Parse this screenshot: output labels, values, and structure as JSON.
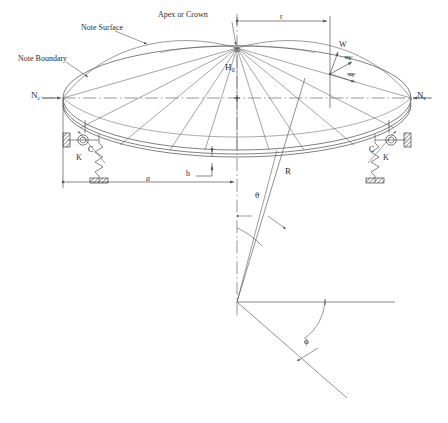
{
  "figure": {
    "type": "engineering-diagram",
    "background": "#ffffff",
    "line_color": "#555555",
    "text_color": "#2b2b2b"
  },
  "labels": {
    "note_surface": "Note Surface",
    "note_boundary": "Note Boundary",
    "apex": "Apex or Crown",
    "nc_left": "N",
    "nc_left_sub": "c",
    "nc_right": "N",
    "nc_right_sub": "c",
    "height": "H",
    "height_sub": "0",
    "radius_r": "r",
    "radius_a": "a",
    "thickness_h": "h",
    "radius_R": "R",
    "angle_theta": "θ",
    "angle_phi": "ϕ",
    "disp_w": "W",
    "disp_u_phi": "u",
    "disp_u_phi_sub": "ϕ",
    "disp_u_theta": "u",
    "disp_u_theta_sub": "θ",
    "spring_left": "K",
    "spring_right": "K",
    "damper_left": "C",
    "damper_right": "C"
  },
  "geometry": {
    "apex_x": 237,
    "apex_y": 48,
    "ellipse_cx": 237,
    "ellipse_cy": 98,
    "ellipse_rx": 174,
    "ellipse_ry": 52,
    "center_of_curvature_x": 237,
    "center_of_curvature_y": 302,
    "shell_thickness_px": 4,
    "dimension_r_value": "r",
    "dimension_a_value": "a"
  }
}
